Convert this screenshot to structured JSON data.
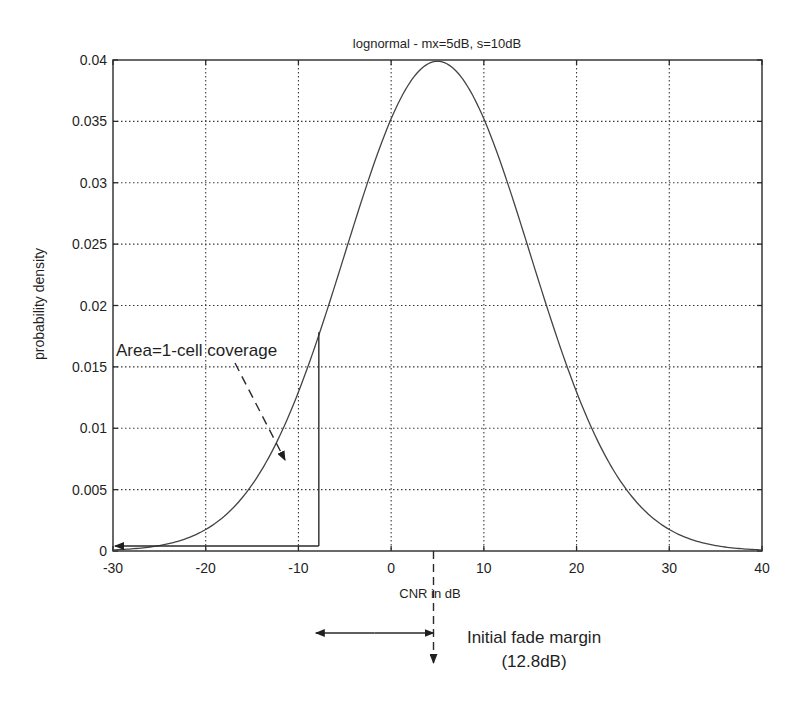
{
  "chart_data": {
    "type": "line",
    "title": "lognormal - mx=5dB, s=10dB",
    "xlabel": "CNR in dB",
    "ylabel": "probability density",
    "xlim": [
      -30,
      40
    ],
    "ylim": [
      0,
      0.04
    ],
    "grid": true,
    "xticks": [
      -30,
      -20,
      -10,
      0,
      10,
      20,
      30,
      40
    ],
    "xtick_labels": [
      "-30",
      "-20",
      "-10",
      "0",
      "10",
      "20",
      "30",
      "40"
    ],
    "yticks": [
      0,
      0.005,
      0.01,
      0.015,
      0.02,
      0.025,
      0.03,
      0.035,
      0.04
    ],
    "ytick_labels": [
      "0",
      "0.005",
      "0.01",
      "0.015",
      "0.02",
      "0.025",
      "0.03",
      "0.035",
      "0.04"
    ],
    "series": [
      {
        "name": "lognormal pdf (mean 5 dB, std 10 dB)",
        "mean": 5,
        "std": 10,
        "x": [
          -30,
          -25,
          -20,
          -15,
          -10,
          -7.8,
          -5,
          0,
          5,
          10,
          15,
          20,
          25,
          30,
          35,
          40
        ],
        "values": [
          9e-05,
          0.00044,
          0.00175,
          0.0054,
          0.01295,
          0.0176,
          0.0242,
          0.0352,
          0.0399,
          0.0352,
          0.0242,
          0.01295,
          0.0054,
          0.00175,
          0.00044,
          9e-05
        ]
      }
    ],
    "annotations": [
      {
        "text": "Area=1-cell coverage",
        "type": "region",
        "region_x": [
          -30,
          -7.8
        ],
        "threshold_x": -7.8
      },
      {
        "text": "Initial fade margin",
        "subtext": "(12.8dB)",
        "type": "double-arrow",
        "from_x": -7.8,
        "to_x": 5
      }
    ]
  },
  "annotation_text": {
    "area": "Area=1-cell coverage",
    "fade_margin": "Initial fade margin",
    "fade_margin_value": "(12.8dB)"
  }
}
